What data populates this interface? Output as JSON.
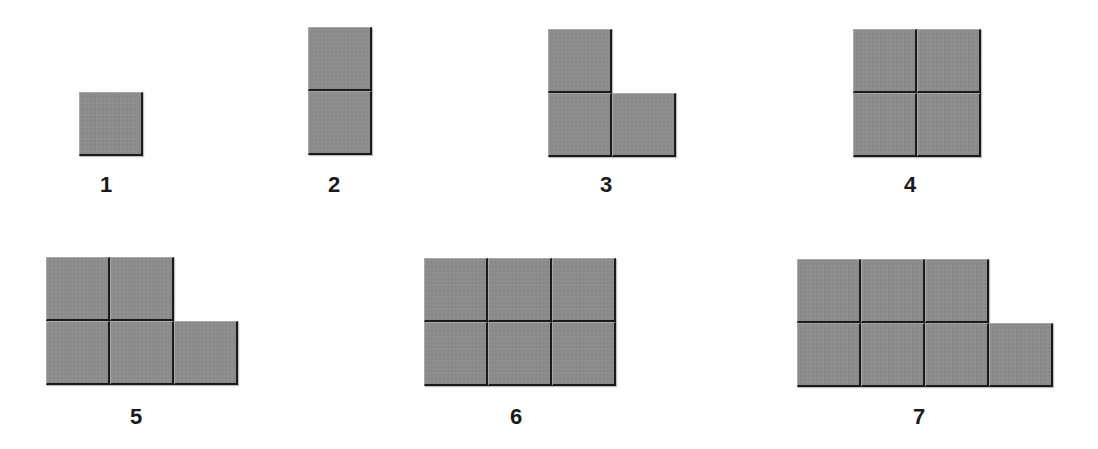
{
  "diagram": {
    "tile_color": "#8d8d8d",
    "edge_color": "#1a1a1a",
    "tile_size": 64,
    "figures": [
      {
        "label": "1",
        "count": 1,
        "origin": [
          79,
          92
        ],
        "label_pos": [
          92,
          173
        ],
        "cells": [
          [
            0,
            0
          ]
        ]
      },
      {
        "label": "2",
        "count": 2,
        "origin": [
          308,
          27
        ],
        "label_pos": [
          320,
          173
        ],
        "cells": [
          [
            0,
            0
          ],
          [
            0,
            1
          ]
        ]
      },
      {
        "label": "3",
        "count": 3,
        "origin": [
          548,
          29
        ],
        "label_pos": [
          592,
          173
        ],
        "cells": [
          [
            0,
            0
          ],
          [
            0,
            1
          ],
          [
            1,
            1
          ]
        ]
      },
      {
        "label": "4",
        "count": 4,
        "origin": [
          853,
          29
        ],
        "label_pos": [
          896,
          173
        ],
        "cells": [
          [
            0,
            0
          ],
          [
            1,
            0
          ],
          [
            0,
            1
          ],
          [
            1,
            1
          ]
        ]
      },
      {
        "label": "5",
        "count": 5,
        "origin": [
          46,
          257
        ],
        "label_pos": [
          122,
          405
        ],
        "cells": [
          [
            0,
            0
          ],
          [
            1,
            0
          ],
          [
            0,
            1
          ],
          [
            1,
            1
          ],
          [
            2,
            1
          ]
        ]
      },
      {
        "label": "6",
        "count": 6,
        "origin": [
          424,
          258
        ],
        "label_pos": [
          502,
          405
        ],
        "cells": [
          [
            0,
            0
          ],
          [
            1,
            0
          ],
          [
            2,
            0
          ],
          [
            0,
            1
          ],
          [
            1,
            1
          ],
          [
            2,
            1
          ]
        ]
      },
      {
        "label": "7",
        "count": 7,
        "origin": [
          797,
          259
        ],
        "label_pos": [
          905,
          405
        ],
        "cells": [
          [
            0,
            0
          ],
          [
            1,
            0
          ],
          [
            2,
            0
          ],
          [
            0,
            1
          ],
          [
            1,
            1
          ],
          [
            2,
            1
          ],
          [
            3,
            1
          ]
        ]
      }
    ]
  }
}
